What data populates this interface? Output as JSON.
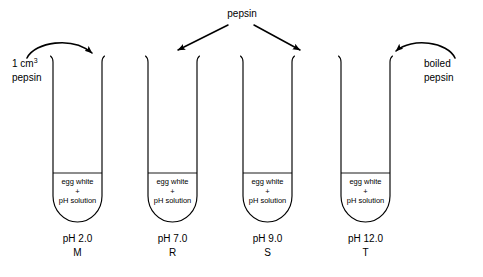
{
  "diagram": {
    "top_label": "pepsin",
    "left_label_line1": "1 cm",
    "left_label_sup": "3",
    "left_label_line2": "pepsin",
    "right_label_line1": "boiled",
    "right_label_line2": "pepsin",
    "contents": {
      "line1": "egg white",
      "line2": "+",
      "line3": "pH solution"
    },
    "tubes": [
      {
        "id": "M",
        "ph": "pH 2.0",
        "label": "M",
        "treatment": "1 cm3 pepsin"
      },
      {
        "id": "R",
        "ph": "pH 7.0",
        "label": "R",
        "treatment": "pepsin"
      },
      {
        "id": "S",
        "ph": "pH 9.0",
        "label": "S",
        "treatment": "pepsin"
      },
      {
        "id": "T",
        "ph": "pH 12.0",
        "label": "T",
        "treatment": "boiled pepsin"
      }
    ],
    "colors": {
      "ink": "#000000",
      "background": "#ffffff"
    }
  }
}
